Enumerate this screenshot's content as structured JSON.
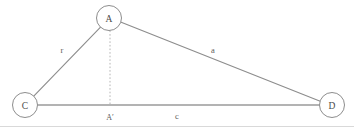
{
  "diagram": {
    "type": "geometry-diagram",
    "canvas": {
      "width": 354,
      "height": 127,
      "background": "#ffffff"
    },
    "colors": {
      "stroke": "#8d8d8d",
      "base_stroke": "#9a9a9a",
      "dashed_stroke": "#b4b4b4",
      "frame": "#d9d9d9",
      "node_fill": "#ffffff",
      "node_text": "#4a4a4a",
      "edge_text": "#5a5a5a"
    },
    "nodes": [
      {
        "id": "A",
        "label": "A",
        "cx": 109,
        "cy": 18,
        "r": 12.5
      },
      {
        "id": "C",
        "label": "C",
        "cx": 25,
        "cy": 105,
        "r": 12.5
      },
      {
        "id": "D",
        "label": "D",
        "cx": 332,
        "cy": 105,
        "r": 12.5
      }
    ],
    "foot_point": {
      "id": "Aprime",
      "label": "A′",
      "x": 110,
      "y": 117
    },
    "edges": [
      {
        "id": "CA",
        "from": "C",
        "to": "A",
        "label": "r",
        "label_x": 62,
        "label_y": 50,
        "style": "solid"
      },
      {
        "id": "AD",
        "from": "A",
        "to": "D",
        "label": "a",
        "label_x": 213,
        "label_y": 50,
        "style": "solid"
      },
      {
        "id": "CD",
        "from": "C",
        "to": "D",
        "label": "c",
        "label_x": 177,
        "label_y": 116,
        "style": "solid-base"
      },
      {
        "id": "AAprime",
        "from": "A",
        "to": "Aprime",
        "label": "",
        "style": "dashed"
      }
    ]
  }
}
